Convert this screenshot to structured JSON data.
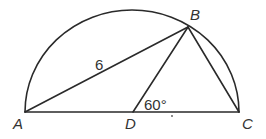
{
  "figure": {
    "type": "geometry",
    "points": {
      "A": {
        "label": "A"
      },
      "B": {
        "label": "B"
      },
      "C": {
        "label": "C"
      },
      "D": {
        "label": "D"
      }
    },
    "segments": [
      {
        "name": "AB",
        "from": "A",
        "to": "B",
        "label": "6"
      },
      {
        "name": "BD",
        "from": "B",
        "to": "D",
        "label": ""
      },
      {
        "name": "BC",
        "from": "B",
        "to": "C",
        "label": ""
      },
      {
        "name": "AC",
        "from": "A",
        "to": "C",
        "label": ""
      }
    ],
    "arc": {
      "name": "semicircle",
      "diameter": "AC"
    },
    "angles": [
      {
        "vertex": "D",
        "between": [
          "B",
          "C"
        ],
        "label": "60°"
      }
    ],
    "labels": {
      "A": "A",
      "B": "B",
      "C": "C",
      "D": "D",
      "AB_length": "6",
      "angle_BDC": "60°"
    },
    "colors": {
      "stroke": "#2a2a2a",
      "text": "#333333",
      "background": "#ffffff"
    }
  }
}
